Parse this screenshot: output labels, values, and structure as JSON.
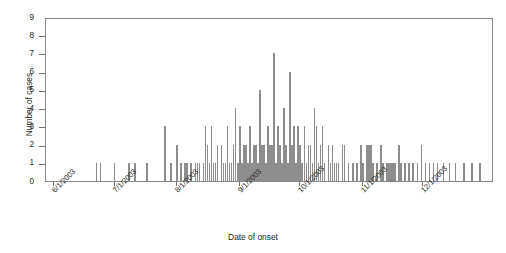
{
  "chart_data": {
    "type": "bar",
    "title": "",
    "subtitle": "",
    "xlabel": "Date of onset",
    "ylabel": "Number of cases",
    "ylim": [
      0,
      9
    ],
    "ytick_labels": [
      "0",
      "1",
      "2",
      "3",
      "4",
      "5",
      "6",
      "7",
      "8",
      "9"
    ],
    "ytick_values": [
      0,
      1,
      2,
      3,
      4,
      5,
      6,
      7,
      8,
      9
    ],
    "xtick_labels": [
      "6/1/2003",
      "7/1/2003",
      "8/1/2003",
      "9/1/2003",
      "10/1/2003",
      "11/1/2003",
      "12/1/2003"
    ],
    "xtick_positions": [
      0,
      30,
      61,
      92,
      122,
      153,
      183
    ],
    "x_unit": "days since 6/1/2003",
    "xlim": [
      -4,
      218
    ],
    "grid": false,
    "legend": null,
    "bar_color": "#8d8d8d",
    "axis_color": "#8a8a8a",
    "x": [
      21,
      23,
      30,
      37,
      40,
      46,
      55,
      58,
      61,
      63,
      65,
      66,
      68,
      70,
      71,
      72,
      74,
      75,
      76,
      77,
      78,
      79,
      80,
      81,
      83,
      84,
      85,
      86,
      87,
      88,
      89,
      90,
      91,
      92,
      93,
      94,
      95,
      96,
      97,
      98,
      99,
      100,
      101,
      102,
      103,
      104,
      105,
      106,
      107,
      108,
      109,
      110,
      111,
      112,
      113,
      114,
      115,
      116,
      117,
      118,
      119,
      120,
      121,
      122,
      123,
      124,
      125,
      126,
      127,
      128,
      129,
      130,
      131,
      132,
      133,
      134,
      136,
      137,
      138,
      139,
      140,
      141,
      143,
      144,
      146,
      148,
      150,
      152,
      153,
      155,
      156,
      157,
      158,
      160,
      162,
      163,
      165,
      166,
      167,
      168,
      169,
      171,
      172,
      174,
      176,
      178,
      180,
      182,
      184,
      186,
      188,
      190,
      193,
      196,
      199,
      203,
      207,
      211
    ],
    "values": [
      1,
      1,
      1,
      1,
      1,
      1,
      3,
      1,
      2,
      1,
      1,
      1,
      1,
      1,
      1,
      1,
      1,
      3,
      2,
      1,
      3,
      1,
      1,
      2,
      2,
      1,
      1,
      3,
      1,
      1,
      2,
      4,
      1,
      3,
      1,
      2,
      2,
      1,
      3,
      1,
      2,
      2,
      1,
      5,
      2,
      2,
      1,
      3,
      2,
      2,
      7,
      1,
      3,
      2,
      1,
      4,
      2,
      1,
      6,
      2,
      3,
      1,
      3,
      2,
      1,
      3,
      1,
      2,
      2,
      1,
      4,
      3,
      1,
      2,
      3,
      1,
      2,
      1,
      2,
      1,
      1,
      1,
      2,
      2,
      1,
      1,
      1,
      2,
      1,
      2,
      2,
      2,
      1,
      1,
      2,
      1,
      1,
      1,
      1,
      1,
      1,
      2,
      1,
      1,
      1,
      1,
      1,
      2,
      1,
      1,
      1,
      1,
      1,
      1,
      1,
      1,
      1,
      1
    ]
  }
}
